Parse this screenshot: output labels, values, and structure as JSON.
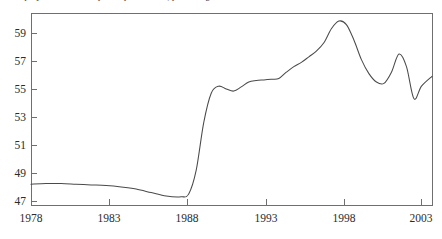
{
  "figure": {
    "caption_clipped": "Unemployment rate and participation rate, percentage",
    "background_color": "#ffffff",
    "frame_color": "#6f6f6f",
    "line_color": "#4a4a4a"
  },
  "chart_data": {
    "type": "line",
    "title": "",
    "subtitle": "",
    "xlabel": "",
    "ylabel": "",
    "xlim": [
      1978,
      2004.7
    ],
    "ylim": [
      46.2,
      60.4
    ],
    "grid": false,
    "legend": null,
    "x_ticks": [
      1978,
      1983,
      1988,
      1993,
      1998,
      2003
    ],
    "x_tick_labels": [
      "1978",
      "1983",
      "1988",
      "1993",
      "1998",
      "2003"
    ],
    "y_ticks": [
      47,
      49,
      51,
      53,
      55,
      57,
      59
    ],
    "y_tick_labels": [
      "47",
      "49",
      "51",
      "53",
      "55",
      "57",
      "59"
    ],
    "series": [
      {
        "name": "rate",
        "x": [
          1978,
          1979,
          1980,
          1981,
          1982,
          1983,
          1984,
          1985,
          1986,
          1987,
          1988,
          1988.5,
          1989,
          1989.5,
          1990,
          1990.5,
          1991,
          1991.5,
          1992,
          1992.5,
          1993,
          1993.5,
          1994,
          1994.5,
          1995,
          1995.5,
          1996,
          1996.5,
          1997,
          1997.5,
          1998,
          1998.5,
          1999,
          1999.5,
          2000,
          2000.5,
          2001,
          2001.5,
          2002,
          2002.5,
          2003,
          2003.5,
          2004,
          2004.7
        ],
        "y": [
          48.2,
          48.25,
          48.25,
          48.2,
          48.15,
          48.1,
          48.0,
          47.85,
          47.6,
          47.35,
          47.3,
          47.5,
          49.2,
          52.6,
          54.7,
          55.2,
          55.0,
          54.85,
          55.15,
          55.5,
          55.6,
          55.65,
          55.7,
          55.75,
          56.2,
          56.6,
          56.9,
          57.3,
          57.7,
          58.3,
          59.3,
          59.85,
          59.6,
          58.5,
          57.1,
          56.1,
          55.5,
          55.4,
          56.2,
          57.5,
          56.6,
          54.3,
          55.2,
          55.9
        ]
      }
    ]
  },
  "axes": {
    "y_axis_label_name": "y-axis",
    "x_axis_label_name": "x-axis"
  }
}
